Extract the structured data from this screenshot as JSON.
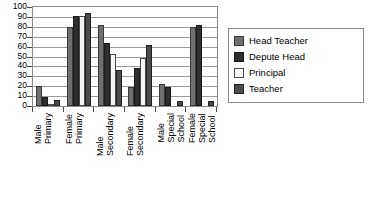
{
  "chart_data": {
    "type": "bar",
    "title": "",
    "xlabel": "",
    "ylabel": "",
    "ylim": [
      0,
      100
    ],
    "ytick_labels": [
      "100",
      "90",
      "80",
      "70",
      "60",
      "50",
      "40",
      "30",
      "20",
      "10",
      "0"
    ],
    "ytick_values": [
      100,
      90,
      80,
      70,
      60,
      50,
      40,
      30,
      20,
      10,
      0
    ],
    "grid": true,
    "legend_position": "right",
    "categories": [
      "Male Primary",
      "Female Primary",
      "Male Secondary",
      "Female Secondary",
      "Male Special School",
      "Female Special School"
    ],
    "category_lines": [
      [
        "Male",
        "Primary"
      ],
      [
        "Female",
        "Primary"
      ],
      [
        "Male",
        "Secondary"
      ],
      [
        "Female",
        "Secondary"
      ],
      [
        "Male",
        "Special",
        "School"
      ],
      [
        "Female",
        "Special",
        "School"
      ]
    ],
    "series": [
      {
        "name": "Head Teacher",
        "color": "#6f6f6f",
        "values": [
          20,
          80,
          82,
          19,
          22,
          80
        ]
      },
      {
        "name": "Depute Head",
        "color": "#2e2e2e",
        "values": [
          9,
          91,
          64,
          38,
          19,
          82
        ]
      },
      {
        "name": "Principal",
        "color": "#f5f5f5",
        "values": [
          1,
          91,
          53,
          48,
          0,
          0
        ]
      },
      {
        "name": "Teacher",
        "color": "#4a4a4a",
        "values": [
          6,
          94,
          36,
          62,
          5,
          5
        ]
      }
    ]
  },
  "legend": {
    "items": [
      {
        "label": "Head Teacher"
      },
      {
        "label": "Depute Head"
      },
      {
        "label": "Principal"
      },
      {
        "label": "Teacher"
      }
    ]
  }
}
